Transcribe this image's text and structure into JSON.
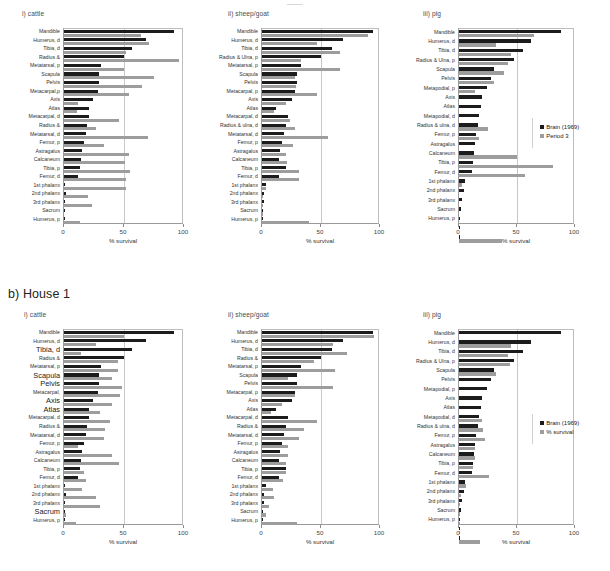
{
  "figure": {
    "sections": [
      {
        "id": "a",
        "title": ""
      },
      {
        "id": "b",
        "title": "b) House 1"
      }
    ],
    "axis": {
      "xlabel": "% survival",
      "ticks": [
        "0",
        "50",
        "100"
      ],
      "xmin": 0,
      "xmax": 100
    },
    "colors": {
      "series0": "#1c1c1c",
      "series1": "#9d9d9d",
      "grid": "#c8c8c8",
      "axis": "#9a9a9a",
      "text": "#333333"
    }
  },
  "legends": {
    "top": {
      "entries": [
        "Brain (1969)",
        "Period 3"
      ]
    },
    "bottom": {
      "entries": [
        "Brain (1969)",
        "% survival"
      ]
    }
  },
  "chart_data": [
    {
      "id": "a-i-cattle",
      "type": "bar",
      "orientation": "horizontal",
      "title": "i) cattle",
      "xlabel": "% survival",
      "ylabel": "",
      "xlim": [
        0,
        100
      ],
      "grid": true,
      "legend": "right",
      "series": [
        {
          "name": "Brain (1969)",
          "values": [
            92,
            68,
            57,
            50,
            31,
            29,
            29,
            28,
            24,
            21,
            21,
            19,
            18,
            17,
            15,
            14,
            13,
            12,
            1,
            1.5,
            1,
            1,
            0.5
          ]
        },
        {
          "name": "Period 3",
          "values": [
            64,
            71,
            52,
            96,
            50,
            75,
            65,
            54,
            12,
            11,
            46,
            27,
            70,
            33,
            54,
            51,
            55,
            52,
            52,
            20,
            23,
            0,
            13
          ]
        }
      ],
      "categories": [
        "Mandible",
        "Humerus, d",
        "Tibia, d",
        "Radius &",
        "Metatarsal, p",
        "Scapula",
        "Pelvis",
        "Metacarpal,p",
        "Axis",
        "Atlas",
        "Metacarpal, d",
        "Radius &",
        "Metatarsal, d",
        "Femur, p",
        "Astragalus",
        "Calcaneum",
        "Tibia, p",
        "Femur, d",
        "1st phalanx",
        "2nd phalanx",
        "3rd phalanx",
        "Sacrum",
        "Humerus, p"
      ]
    },
    {
      "id": "a-ii-sheepgoat",
      "type": "bar",
      "orientation": "horizontal",
      "title": "ii) sheep/goat",
      "xlabel": "% survival",
      "ylabel": "",
      "xlim": [
        0,
        100
      ],
      "grid": true,
      "legend": "right",
      "series": [
        {
          "name": "Brain (1969)",
          "values": [
            94,
            69,
            59,
            50,
            33,
            30,
            30,
            28,
            25,
            12,
            22,
            20,
            19,
            17,
            15,
            14,
            20,
            14,
            3,
            2,
            1.5,
            1,
            1
          ]
        },
        {
          "name": "Period 3",
          "values": [
            90,
            47,
            66,
            33,
            66,
            28,
            29,
            47,
            20,
            10,
            24,
            28,
            56,
            26,
            20,
            21,
            31,
            31,
            3,
            1,
            1,
            1,
            40
          ]
        }
      ],
      "categories": [
        "Mandible",
        "Humerus, d",
        "Tibia, d",
        "Radius & Ulna, p",
        "Metatarsal, p",
        "Scapula",
        "Pelvis",
        "Metacarpal, p",
        "Axis",
        "Atlas",
        "Metacarpal, d",
        "Radius & ulna, d",
        "Metatarsal, d",
        "Femur, p",
        "Astragalus",
        "Calcaneum",
        "Tibia, p",
        "Femur, d",
        "1st phalanx",
        "2nd phalanx",
        "3rd phalanx",
        "Sacrum",
        "Humerus, p"
      ]
    },
    {
      "id": "a-iii-pig",
      "type": "bar",
      "orientation": "horizontal",
      "title": "iii) pig",
      "xlabel": "% survival",
      "ylabel": "",
      "xlim": [
        0,
        100
      ],
      "grid": true,
      "legend": "right",
      "series": [
        {
          "name": "Brain (1969)",
          "values": [
            88,
            62,
            55,
            47,
            30,
            28,
            24,
            20,
            19,
            17,
            16,
            15,
            14,
            13,
            12,
            11,
            5,
            4,
            3,
            2,
            1,
            1,
            1
          ]
        },
        {
          "name": "Period 3",
          "values": [
            65,
            32,
            45,
            42,
            39,
            30,
            14,
            0,
            0,
            0,
            25,
            17,
            0,
            50,
            81,
            57,
            3,
            0,
            0,
            0,
            0,
            0,
            37
          ]
        }
      ],
      "categories": [
        "Mandible",
        "Humerus, d",
        "Tibia, d",
        "Radius & Ulna, p",
        "Scapula",
        "Pelvis",
        "Metapodial, p",
        "Axis",
        "Atlas",
        "Metapodial, d",
        "Radius & ulna, d",
        "Femur, p",
        "Astragalus",
        "Calcaneum",
        "Tibia, p",
        "Femur, d",
        "1st phalanx",
        "2nd phalanx",
        "3rd phalanx",
        "Sacrum",
        "Humerus, p"
      ]
    },
    {
      "id": "b-i-cattle",
      "type": "bar",
      "orientation": "horizontal",
      "title": "i) cattle",
      "xlabel": "% survival",
      "ylabel": "",
      "xlim": [
        0,
        100
      ],
      "grid": true,
      "legend": "none",
      "series": [
        {
          "name": "Brain (1969)",
          "values": [
            92,
            68,
            57,
            50,
            31,
            29,
            29,
            28,
            24,
            21,
            21,
            19,
            18,
            17,
            15,
            14,
            13,
            12,
            1,
            1.5,
            1,
            1,
            0.5
          ]
        },
        {
          "name": "% survival",
          "values": [
            50,
            27,
            14,
            45,
            45,
            40,
            48,
            47,
            40,
            30,
            38,
            34,
            33,
            12,
            40,
            46,
            17,
            18,
            15,
            27,
            30,
            2,
            10
          ]
        }
      ],
      "categories": [
        "Mandible",
        "Humerus, d",
        "Tibia, d",
        "Radius &",
        "Metatarsal, p",
        "Scapula",
        "Pelvis",
        "Metacarpal,",
        "Axis",
        "Atlas",
        "Metacarpal, d",
        "Radius &",
        "Metatarsal, d",
        "Femur, p",
        "Astragalus",
        "Calcaneum",
        "Tibia, p",
        "Femur, d",
        "1st phalanx",
        "2nd phalanx",
        "3rd phalanx",
        "Sacrum",
        "Humerus, p"
      ],
      "emphasized": [
        "Tibia, d",
        "Scapula",
        "Pelvis",
        "Axis",
        "Atlas",
        "Sacrum"
      ]
    },
    {
      "id": "b-ii-sheepgoat",
      "type": "bar",
      "orientation": "horizontal",
      "title": "ii) sheep/goat",
      "xlabel": "% survival",
      "ylabel": "",
      "xlim": [
        0,
        100
      ],
      "grid": true,
      "legend": "none",
      "series": [
        {
          "name": "Brain (1969)",
          "values": [
            94,
            69,
            59,
            50,
            33,
            30,
            30,
            28,
            25,
            12,
            22,
            20,
            19,
            17,
            15,
            14,
            20,
            14,
            3,
            2,
            1.5,
            1,
            1
          ]
        },
        {
          "name": "% survival",
          "values": [
            95,
            60,
            72,
            44,
            62,
            22,
            60,
            28,
            17,
            8,
            47,
            36,
            31,
            22,
            22,
            20,
            20,
            18,
            9,
            10,
            6,
            3,
            30
          ]
        }
      ],
      "categories": [
        "Mandible",
        "Humerus, d",
        "Tibia, d",
        "Radius &",
        "Metatarsal, p",
        "Scapula",
        "Pelvis",
        "Metacarpal, p",
        "Axis",
        "Atlas",
        "Metacarpal, d",
        "Radius &",
        "Metatarsal, d",
        "Femur, p",
        "Astragalus",
        "Calcaneum",
        "Tibia, p",
        "Femur, d",
        "1st phalanx",
        "2nd phalanx",
        "3rd phalanx",
        "Sacrum",
        "Humerus, p"
      ]
    },
    {
      "id": "b-iii-pig",
      "type": "bar",
      "orientation": "horizontal",
      "title": "iii) pig",
      "xlabel": "% survival",
      "ylabel": "",
      "xlim": [
        0,
        100
      ],
      "grid": true,
      "legend": "right",
      "series": [
        {
          "name": "Brain (1969)",
          "values": [
            88,
            62,
            55,
            47,
            30,
            28,
            24,
            20,
            19,
            17,
            16,
            15,
            14,
            13,
            12,
            11,
            5,
            4,
            3,
            2,
            1,
            1,
            1
          ]
        },
        {
          "name": "% survival",
          "values": [
            0,
            45,
            42,
            44,
            32,
            0,
            0,
            0,
            0,
            20,
            21,
            22,
            14,
            14,
            12,
            26,
            6,
            2,
            1,
            1,
            1,
            1,
            18
          ]
        }
      ],
      "categories": [
        "Mandible",
        "Humerus, d",
        "Tibia, d",
        "Radius & Ulna, p",
        "Scapula",
        "Pelvis",
        "Metapodial, p",
        "Axis",
        "Atlas",
        "Metapodial, d",
        "Radius & ulna, d",
        "Femur, p",
        "Astragalus",
        "Calcaneum",
        "Tibia, p",
        "Femur, d",
        "1st phalanx",
        "2nd phalanx",
        "3rd phalanx",
        "Sacrum",
        "Humerus, p"
      ]
    }
  ]
}
